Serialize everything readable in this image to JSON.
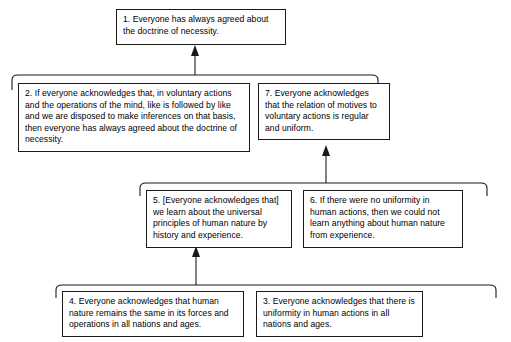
{
  "diagram": {
    "nodes": [
      {
        "id": "n1",
        "number": "1.",
        "text": "1. Everyone has always agreed about the doctrine of necessity."
      },
      {
        "id": "n2",
        "number": "2.",
        "text": "2. If everyone acknowledges that, in voluntary actions and the operations of the mind, like is followed by like and we are disposed to make inferences on that basis, then everyone has always agreed about the doctrine of necessity."
      },
      {
        "id": "n7",
        "number": "7.",
        "text": "7. Everyone acknowledges that the relation of motives to voluntary actions is regular and uniform."
      },
      {
        "id": "n5",
        "number": "5.",
        "text": "5. [Everyone acknowledges that] we learn about the universal principles of human nature by history and experience."
      },
      {
        "id": "n6",
        "number": "6.",
        "text": "6. If there were no uniformity in human actions, then we could not learn anything about human nature from experience."
      },
      {
        "id": "n4",
        "number": "4.",
        "text": "4. Everyone acknowledges that human nature remains the same in its forces and operations in all nations and ages."
      },
      {
        "id": "n3",
        "number": "3.",
        "text": "3. Everyone acknowledges that there is uniformity in human actions in all nations and ages."
      }
    ],
    "links": [
      {
        "id": "l1",
        "from": [
          "2",
          "7"
        ],
        "to": "1",
        "kind": "linked-support"
      },
      {
        "id": "l2",
        "from": [
          "5",
          "6"
        ],
        "to": "7",
        "kind": "linked-support"
      },
      {
        "id": "l3",
        "from": [
          "4",
          "3"
        ],
        "to": "5",
        "kind": "linked-support"
      }
    ],
    "colors": {
      "line": "#1a1a1a",
      "box_border": "#1a1a1a",
      "background": "#ffffff",
      "text": "#000000"
    }
  }
}
